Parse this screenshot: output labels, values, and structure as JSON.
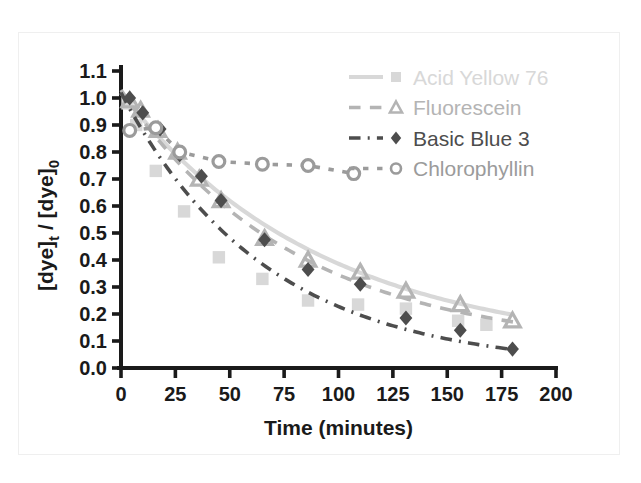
{
  "figure": {
    "clipped_top_caption": "",
    "background_color": "#ffffff",
    "frame_color": "#efefef"
  },
  "chart_data": {
    "type": "scatter",
    "title": "",
    "subtitle": "",
    "xlabel": "Time (minutes)",
    "ylabel": "[dye]t / [dye]0",
    "ylabel_parts": {
      "base1": "[dye]",
      "sub1": "t",
      "divider": " / ",
      "base2": "[dye]",
      "sub2": "0"
    },
    "xlim": [
      0,
      200
    ],
    "ylim": [
      0.0,
      1.1
    ],
    "xticks": [
      0,
      25,
      50,
      75,
      100,
      125,
      150,
      175,
      200
    ],
    "yticks": [
      "0.0",
      "0.1",
      "0.2",
      "0.3",
      "0.4",
      "0.5",
      "0.6",
      "0.7",
      "0.8",
      "0.9",
      "1.0",
      "1.1"
    ],
    "grid": false,
    "legend_position": "top-right",
    "axis_color": "#1a1a1a",
    "series": [
      {
        "name": "Acid Yellow 76",
        "color": "#d8d8d8",
        "marker": "square-filled",
        "linestyle": "solid",
        "legend_label": "Acid Yellow 76",
        "x": [
          3,
          7,
          16,
          29,
          45,
          65,
          86,
          109,
          131,
          155,
          168
        ],
        "y": [
          0.98,
          0.9,
          0.73,
          0.58,
          0.41,
          0.33,
          0.25,
          0.235,
          0.22,
          0.175,
          0.16
        ],
        "fit_curve": {
          "model": "exponential-decay",
          "y0": 1.02,
          "k": 0.0108,
          "offset": 0.06,
          "x_range": [
            0,
            180
          ]
        }
      },
      {
        "name": "Fluorescein",
        "color": "#b4b4b4",
        "marker": "triangle-open",
        "linestyle": "dashed",
        "legend_label": "Fluorescein",
        "x": [
          4,
          9,
          17,
          26,
          36,
          46,
          66,
          86,
          110,
          131,
          156,
          180
        ],
        "y": [
          0.99,
          0.955,
          0.88,
          0.8,
          0.7,
          0.62,
          0.48,
          0.4,
          0.355,
          0.285,
          0.235,
          0.175
        ],
        "fit_curve": {
          "model": "exponential-decay",
          "y0": 1.03,
          "k": 0.0125,
          "offset": 0.07,
          "x_range": [
            0,
            182
          ]
        }
      },
      {
        "name": "Basic Blue 3",
        "color": "#4d4d4d",
        "marker": "diamond-filled",
        "linestyle": "dash-dot",
        "legend_label": "Basic Blue 3",
        "x": [
          4,
          10,
          18,
          27,
          37,
          46,
          66,
          86,
          110,
          131,
          156,
          180
        ],
        "y": [
          1.0,
          0.945,
          0.885,
          0.79,
          0.71,
          0.62,
          0.475,
          0.365,
          0.31,
          0.185,
          0.14,
          0.07
        ],
        "fit_curve": {
          "model": "exponential-decay",
          "y0": 1.02,
          "k": 0.015,
          "offset": 0.0,
          "x_range": [
            0,
            181
          ]
        }
      },
      {
        "name": "Chlorophyllin",
        "color": "#9b9b9b",
        "marker": "circle-open",
        "linestyle": "dotted",
        "legend_label": "Chlorophyllin",
        "x": [
          4,
          16,
          27,
          45,
          65,
          86,
          107
        ],
        "y": [
          0.88,
          0.89,
          0.8,
          0.765,
          0.755,
          0.75,
          0.72
        ],
        "fit_curve": {
          "model": "linear-segments",
          "x_range": [
            4,
            107
          ]
        }
      }
    ]
  },
  "legend": {
    "entries": [
      {
        "label": "Acid Yellow 76",
        "color": "#d8d8d8",
        "marker": "square-filled",
        "linestyle": "solid"
      },
      {
        "label": "Fluorescein",
        "color": "#b4b4b4",
        "marker": "triangle-open",
        "linestyle": "dashed"
      },
      {
        "label": "Basic Blue 3",
        "color": "#4d4d4d",
        "marker": "diamond-filled",
        "linestyle": "dash-dot"
      },
      {
        "label": "Chlorophyllin",
        "color": "#9b9b9b",
        "marker": "circle-open",
        "linestyle": "dotted"
      }
    ]
  }
}
